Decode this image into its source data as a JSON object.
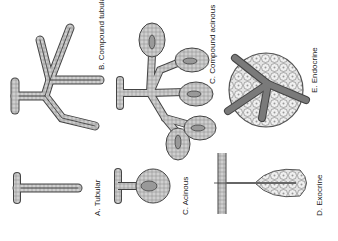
{
  "figure": {
    "orientation": "rotated 90 degrees counter-clockwise",
    "panels": [
      {
        "id": "A",
        "label": "A. Tubular"
      },
      {
        "id": "B",
        "label": "B. Compound tubular"
      },
      {
        "id": "C1",
        "label": "C. Acinous"
      },
      {
        "id": "C2",
        "label": "C. Compound acinous"
      },
      {
        "id": "D",
        "label": "D. Exocrine"
      },
      {
        "id": "E",
        "label": "E. Endocrine"
      }
    ],
    "colors": {
      "duct_wall": "#6e6e6e",
      "cells": "#c8c8c8",
      "lumen": "#9a9a9a",
      "outline": "#333333",
      "vessel": "#707070"
    }
  }
}
